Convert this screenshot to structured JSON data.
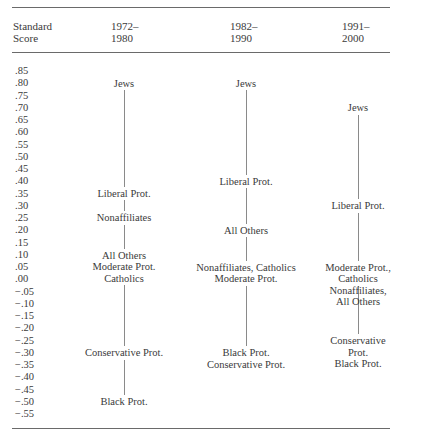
{
  "header": {
    "score_label": "Standard\nScore",
    "periods": [
      "1972–\n1980",
      "1982–\n1990",
      "1991–\n2000"
    ]
  },
  "scale": [
    ".85",
    ".80",
    ".75",
    ".70",
    ".65",
    ".60",
    ".55",
    ".50",
    ".45",
    ".40",
    ".35",
    ".30",
    ".25",
    ".20",
    ".15",
    ".10",
    ".05",
    ".00",
    "−.05",
    "−.10",
    "−.15",
    "−.20",
    "−.25",
    "−.30",
    "−.35",
    "−.40",
    "−.45",
    "−.50",
    "−.55"
  ],
  "columns": [
    {
      "period": "1972–1980",
      "labels": [
        {
          "text": "Jews",
          "score": 0.8
        },
        {
          "text": "Liberal Prot.",
          "score": 0.35
        },
        {
          "text": "Nonaffiliates",
          "score": 0.25
        },
        {
          "text": "All Others\nModerate Prot.\nCatholics",
          "score": 0.05
        },
        {
          "text": "Conservative Prot.",
          "score": -0.3
        },
        {
          "text": "Black Prot.",
          "score": -0.5
        }
      ]
    },
    {
      "period": "1982–1990",
      "labels": [
        {
          "text": "Jews",
          "score": 0.8
        },
        {
          "text": "Liberal Prot.",
          "score": 0.4
        },
        {
          "text": "All Others",
          "score": 0.2
        },
        {
          "text": "Nonaffiliates, Catholics\nModerate Prot.",
          "score": 0.025
        },
        {
          "text": "Black Prot.\nConservative Prot.",
          "score": -0.325
        }
      ]
    },
    {
      "period": "1991–2000",
      "labels": [
        {
          "text": "Jews",
          "score": 0.7
        },
        {
          "text": "Liberal Prot.",
          "score": 0.3
        },
        {
          "text": "Moderate Prot., Catholics\nNonaffiliates, All Others",
          "score": 0.025
        },
        {
          "text": "Conservative Prot.\nBlack Prot.",
          "score": -0.275
        }
      ]
    }
  ],
  "chart_data": {
    "type": "table",
    "title": "",
    "ylabel": "Standard Score",
    "ylim": [
      -0.55,
      0.85
    ],
    "categories": [
      "1972–1980",
      "1982–1990",
      "1991–2000"
    ],
    "series": [
      {
        "name": "Jews",
        "values": [
          0.8,
          0.8,
          0.7
        ]
      },
      {
        "name": "Liberal Prot.",
        "values": [
          0.35,
          0.4,
          0.3
        ]
      },
      {
        "name": "Nonaffiliates",
        "values": [
          0.25,
          0.05,
          0.0
        ]
      },
      {
        "name": "All Others",
        "values": [
          0.1,
          0.2,
          0.0
        ]
      },
      {
        "name": "Moderate Prot.",
        "values": [
          0.05,
          0.0,
          0.05
        ]
      },
      {
        "name": "Catholics",
        "values": [
          0.0,
          0.05,
          0.05
        ]
      },
      {
        "name": "Conservative Prot.",
        "values": [
          -0.3,
          -0.35,
          -0.25
        ]
      },
      {
        "name": "Black Prot.",
        "values": [
          -0.5,
          -0.3,
          -0.3
        ]
      }
    ]
  }
}
